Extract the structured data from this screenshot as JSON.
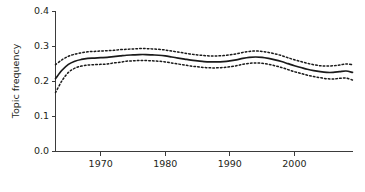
{
  "chart_data": {
    "type": "line",
    "title": "",
    "subtitle": "",
    "xlabel": "",
    "ylabel": "Topic frequency",
    "xlim": [
      1963,
      2009
    ],
    "ylim": [
      0.0,
      0.4
    ],
    "grid": false,
    "legend": null,
    "x_ticks": [
      1970,
      1980,
      1990,
      2000
    ],
    "x_tick_labels": [
      "1970",
      "1980",
      "1990",
      "2000"
    ],
    "y_ticks": [
      0.0,
      0.1,
      0.2,
      0.3,
      0.4
    ],
    "y_tick_labels": [
      "0.0",
      "0.1",
      "0.2",
      "0.3",
      "0.4"
    ],
    "x": [
      1963,
      1964,
      1965,
      1966,
      1967,
      1968,
      1969,
      1970,
      1971,
      1972,
      1973,
      1974,
      1975,
      1976,
      1977,
      1978,
      1979,
      1980,
      1981,
      1982,
      1983,
      1984,
      1985,
      1986,
      1987,
      1988,
      1989,
      1990,
      1991,
      1992,
      1993,
      1994,
      1995,
      1996,
      1997,
      1998,
      1999,
      2000,
      2001,
      2002,
      2003,
      2004,
      2005,
      2006,
      2007,
      2008,
      2009
    ],
    "series": [
      {
        "name": "Topic frequency (fitted)",
        "style": "solid",
        "values": [
          0.208,
          0.232,
          0.249,
          0.258,
          0.263,
          0.266,
          0.267,
          0.268,
          0.269,
          0.271,
          0.273,
          0.275,
          0.276,
          0.277,
          0.277,
          0.276,
          0.275,
          0.273,
          0.27,
          0.267,
          0.264,
          0.261,
          0.259,
          0.257,
          0.256,
          0.256,
          0.257,
          0.259,
          0.262,
          0.266,
          0.269,
          0.27,
          0.269,
          0.266,
          0.262,
          0.257,
          0.251,
          0.245,
          0.24,
          0.235,
          0.231,
          0.228,
          0.226,
          0.226,
          0.228,
          0.23,
          0.226
        ]
      },
      {
        "name": "Upper confidence bound",
        "style": "dotted",
        "values": [
          0.248,
          0.262,
          0.272,
          0.278,
          0.282,
          0.285,
          0.286,
          0.287,
          0.288,
          0.289,
          0.291,
          0.292,
          0.293,
          0.294,
          0.294,
          0.293,
          0.292,
          0.29,
          0.287,
          0.284,
          0.281,
          0.278,
          0.276,
          0.274,
          0.273,
          0.273,
          0.274,
          0.276,
          0.279,
          0.283,
          0.286,
          0.287,
          0.286,
          0.283,
          0.279,
          0.274,
          0.268,
          0.262,
          0.257,
          0.252,
          0.248,
          0.245,
          0.244,
          0.245,
          0.247,
          0.25,
          0.248
        ]
      },
      {
        "name": "Lower confidence bound",
        "style": "dotted",
        "values": [
          0.168,
          0.202,
          0.226,
          0.238,
          0.244,
          0.247,
          0.248,
          0.249,
          0.25,
          0.253,
          0.255,
          0.258,
          0.259,
          0.26,
          0.26,
          0.259,
          0.258,
          0.256,
          0.253,
          0.25,
          0.247,
          0.244,
          0.242,
          0.24,
          0.239,
          0.239,
          0.24,
          0.242,
          0.245,
          0.249,
          0.252,
          0.253,
          0.252,
          0.249,
          0.245,
          0.24,
          0.234,
          0.228,
          0.223,
          0.218,
          0.214,
          0.211,
          0.208,
          0.207,
          0.209,
          0.21,
          0.204
        ]
      }
    ]
  }
}
